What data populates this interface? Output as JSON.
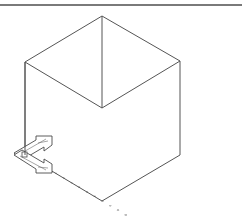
{
  "view": {
    "type": "isometric-wireframe",
    "background": "#ffffff",
    "line_color": "#555555",
    "grid_color": "#bdbdbd",
    "border_color": "#7a7a7a"
  },
  "cube": {
    "vertices": {
      "top": [
        102,
        16
      ],
      "upper_left": [
        25,
        62
      ],
      "upper_right": [
        180,
        61
      ],
      "center": [
        102,
        108
      ],
      "lower_left": [
        25,
        155
      ],
      "lower_right": [
        180,
        155
      ],
      "bottom": [
        102,
        201
      ]
    }
  },
  "grid": {
    "style": "dots",
    "plane": "xy-isometric"
  },
  "ucs_icon": {
    "name": "UCS icon",
    "origin": [
      25,
      155
    ],
    "axes": [
      "X",
      "Y"
    ]
  }
}
